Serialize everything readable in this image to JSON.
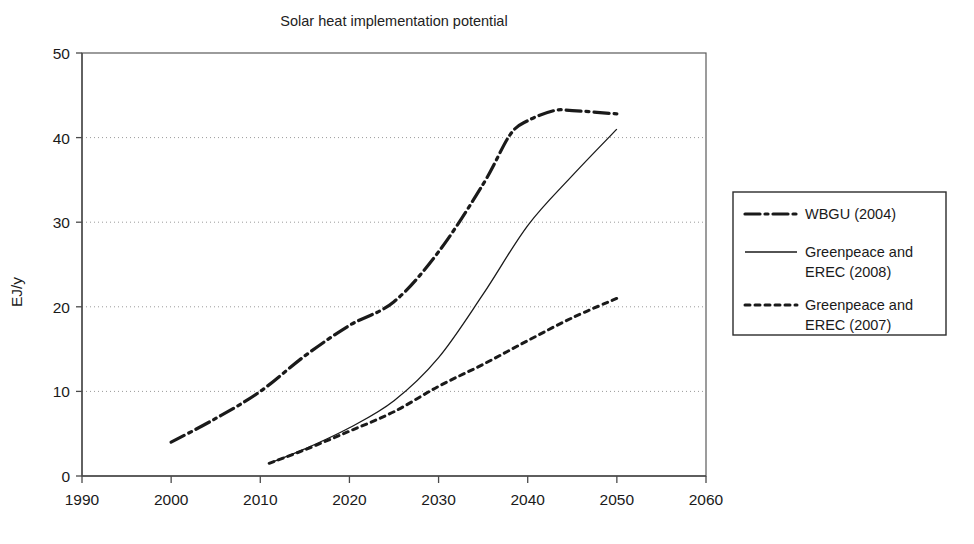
{
  "chart_data": {
    "type": "line",
    "title": "Solar heat implementation potential",
    "xlabel": "",
    "ylabel": "EJ/y",
    "xlim": [
      1990,
      2060
    ],
    "ylim": [
      0,
      50
    ],
    "xticks": [
      "1990",
      "2000",
      "2010",
      "2020",
      "2030",
      "2040",
      "2050",
      "2060"
    ],
    "yticks": [
      "0",
      "10",
      "20",
      "30",
      "40",
      "50"
    ],
    "grid": "horizontal-dotted",
    "legend_position": "right-outside",
    "series": [
      {
        "name": "WBGU (2004)",
        "style": "dash-dot",
        "x": [
          2000,
          2005,
          2010,
          2015,
          2020,
          2025,
          2030,
          2035,
          2038,
          2040,
          2043,
          2045,
          2050
        ],
        "values": [
          4.0,
          6.8,
          10.0,
          14.2,
          17.8,
          20.6,
          26.5,
          34.5,
          40.3,
          42.0,
          43.2,
          43.2,
          42.8
        ]
      },
      {
        "name": "Greenpeace and EREC (2008)",
        "style": "solid",
        "x": [
          2011,
          2015,
          2020,
          2025,
          2030,
          2035,
          2040,
          2045,
          2050
        ],
        "values": [
          1.5,
          3.2,
          5.7,
          8.9,
          14.0,
          21.5,
          29.6,
          35.5,
          41.0
        ]
      },
      {
        "name": "Greenpeace and EREC (2007)",
        "style": "dotted",
        "x": [
          2011,
          2015,
          2020,
          2025,
          2030,
          2035,
          2040,
          2045,
          2050
        ],
        "values": [
          1.5,
          3.1,
          5.3,
          7.6,
          10.6,
          13.2,
          16.0,
          18.7,
          21.0
        ]
      }
    ]
  },
  "legend": {
    "items": [
      {
        "label": "WBGU (2004)",
        "style": "dash-dot"
      },
      {
        "label": "Greenpeace and",
        "label2": "EREC (2008)",
        "style": "solid"
      },
      {
        "label": "Greenpeace and",
        "label2": "EREC (2007)",
        "style": "dotted"
      }
    ]
  },
  "colors": {
    "line": "#1a1a1a",
    "axis": "#4a4a4a",
    "grid": "#9a9a9a",
    "background": "#ffffff"
  }
}
